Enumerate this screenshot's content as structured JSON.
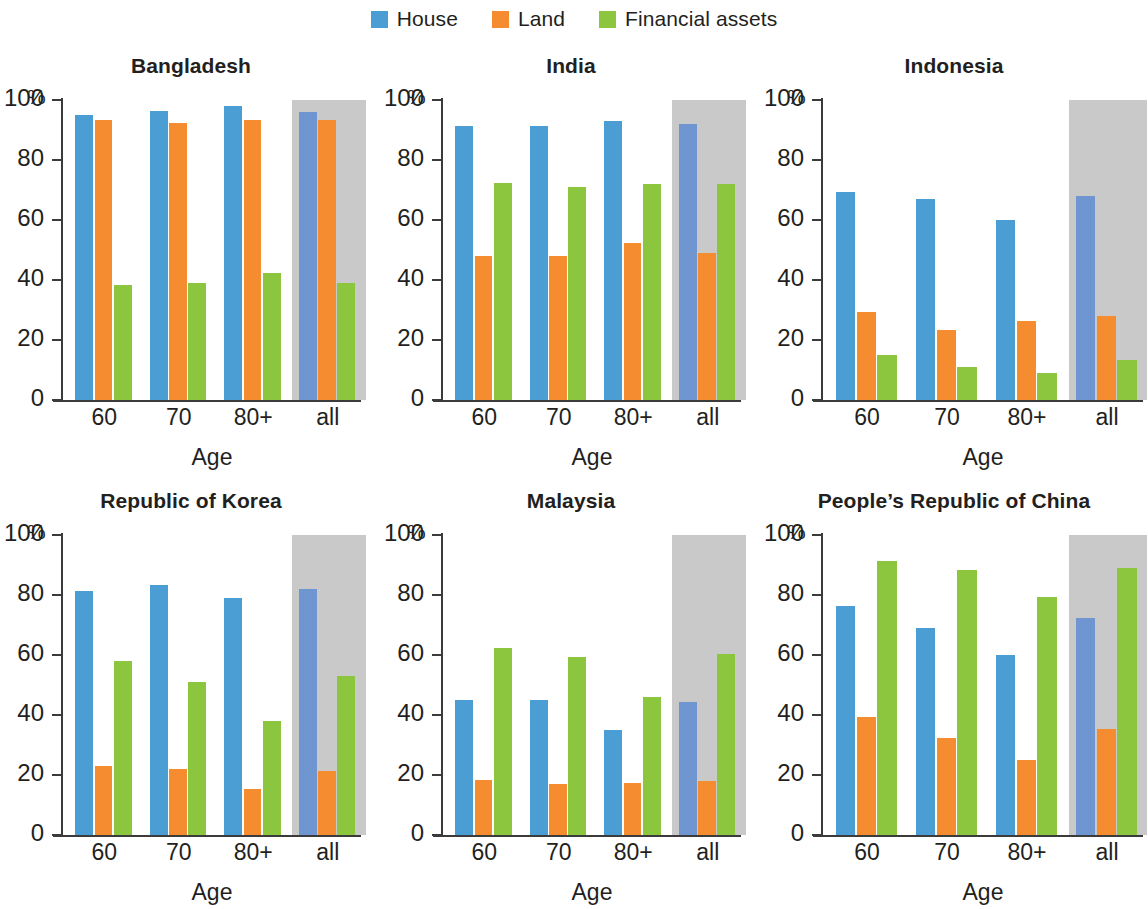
{
  "legend": {
    "entries": [
      {
        "label": "House",
        "color": "#4a9ed4",
        "icon": "legend-swatch-house"
      },
      {
        "label": "Land",
        "color": "#f58c30",
        "icon": "legend-swatch-land"
      },
      {
        "label": "Financial assets",
        "color": "#8cc63e",
        "icon": "legend-swatch-financial-assets"
      }
    ]
  },
  "colors": {
    "house": "#4a9ed4",
    "land": "#f58c30",
    "financial_assets": "#8cc63e",
    "house_all": "#6f96d0",
    "all_group_background": "#c9c9c9",
    "axis": "#3b3b3b",
    "text": "#231f20"
  },
  "axis": {
    "unit": "%",
    "ylabel": "",
    "xlabel": "Age",
    "yticks": [
      0,
      20,
      40,
      60,
      80,
      100
    ],
    "ytick_labels": [
      "0",
      "20",
      "40",
      "60",
      "80",
      "100"
    ],
    "ylim": [
      0,
      100
    ],
    "categories": [
      "60",
      "70",
      "80+",
      "all"
    ]
  },
  "chart_data": {
    "type": "bar",
    "title": "",
    "xlabel": "Age",
    "ylabel": "%",
    "ylim": [
      0,
      100
    ],
    "yticks": [
      0,
      20,
      40,
      60,
      80,
      100
    ],
    "grid": false,
    "legend_position": "top-center",
    "categories": [
      "60",
      "70",
      "80+",
      "all"
    ],
    "series_names": [
      "House",
      "Land",
      "Financial assets"
    ],
    "annotations": [
      "The 'all' category in every panel is drawn over a grey 0-100% background block.",
      "The third-column panels (Indonesia, People's Republic of China) are clipped at the right edge of the image."
    ],
    "panels": [
      {
        "title": "Bangladesh",
        "row": 0,
        "col": 0,
        "series": [
          {
            "name": "House",
            "values": [
              95.0,
              96.5,
              98.0,
              96.0
            ]
          },
          {
            "name": "Land",
            "values": [
              93.5,
              92.5,
              93.5,
              93.5
            ]
          },
          {
            "name": "Financial assets",
            "values": [
              38.5,
              39.0,
              42.5,
              39.0
            ]
          }
        ]
      },
      {
        "title": "India",
        "row": 0,
        "col": 1,
        "series": [
          {
            "name": "House",
            "values": [
              91.5,
              91.5,
              93.0,
              92.0
            ]
          },
          {
            "name": "Land",
            "values": [
              48.0,
              48.0,
              52.5,
              49.0
            ]
          },
          {
            "name": "Financial assets",
            "values": [
              72.5,
              71.0,
              72.0,
              72.0
            ]
          }
        ]
      },
      {
        "title": "Indonesia",
        "row": 0,
        "col": 2,
        "series": [
          {
            "name": "House",
            "values": [
              69.5,
              67.0,
              60.0,
              68.0
            ]
          },
          {
            "name": "Land",
            "values": [
              29.5,
              23.5,
              26.5,
              28.0
            ]
          },
          {
            "name": "Financial assets",
            "values": [
              15.0,
              11.0,
              9.0,
              13.5
            ]
          }
        ]
      },
      {
        "title": "Republic of Korea",
        "row": 1,
        "col": 0,
        "series": [
          {
            "name": "House",
            "values": [
              81.5,
              83.5,
              79.0,
              82.0
            ]
          },
          {
            "name": "Land",
            "values": [
              23.0,
              22.0,
              15.5,
              21.5
            ]
          },
          {
            "name": "Financial assets",
            "values": [
              58.0,
              51.0,
              38.0,
              53.0
            ]
          }
        ]
      },
      {
        "title": "Malaysia",
        "row": 1,
        "col": 1,
        "series": [
          {
            "name": "House",
            "values": [
              45.0,
              45.0,
              35.0,
              44.5
            ]
          },
          {
            "name": "Land",
            "values": [
              18.5,
              17.0,
              17.5,
              18.0
            ]
          },
          {
            "name": "Financial assets",
            "values": [
              62.5,
              59.5,
              46.0,
              60.5
            ]
          }
        ]
      },
      {
        "title": "People’s Republic of China",
        "row": 1,
        "col": 2,
        "series": [
          {
            "name": "House",
            "values": [
              76.5,
              69.0,
              60.0,
              72.5
            ]
          },
          {
            "name": "Land",
            "values": [
              39.5,
              32.5,
              25.0,
              35.5
            ]
          },
          {
            "name": "Financial assets",
            "values": [
              91.5,
              88.5,
              79.5,
              89.0
            ]
          }
        ]
      }
    ]
  }
}
